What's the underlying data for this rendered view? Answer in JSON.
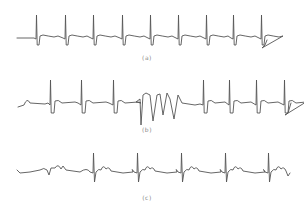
{
  "figure": {
    "panels": [
      {
        "id": "a",
        "caption": "(a)",
        "caption_pos": {
          "x": 147,
          "y": 54
        },
        "baseline_y": 38,
        "r_peak_y": 15,
        "s_trough_y": 45,
        "beats_x": [
          36,
          65,
          93,
          122,
          150,
          178,
          206,
          233,
          261
        ],
        "description": "regular rhythm ECG trace"
      },
      {
        "id": "b",
        "caption": "(b)",
        "caption_pos": {
          "x": 147,
          "y": 126
        },
        "baseline_y": 105,
        "r_peak_y": 80,
        "s_trough_y": 113,
        "beats_before_x": [
          50,
          81,
          113
        ],
        "burst_range_x": [
          140,
          180
        ],
        "beats_after_x": [
          203,
          229,
          256,
          284
        ],
        "description": "ECG trace with run of wide irregular complexes in middle"
      },
      {
        "id": "c",
        "caption": "(c)",
        "caption_pos": {
          "x": 147,
          "y": 194
        },
        "baseline_y": 172,
        "r_peak_y": 153,
        "s_trough_y": 182,
        "beats_x": [
          93,
          137,
          181,
          225,
          268
        ],
        "description": "low-amplitude ECG trace with prominent P/T waves"
      }
    ],
    "colors": {
      "trace": "#555555",
      "caption": "#8a8a8a",
      "background": "#ffffff"
    }
  }
}
